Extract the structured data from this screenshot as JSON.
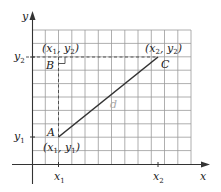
{
  "diagram": {
    "type": "coordinate-distance",
    "axes": {
      "x_label": "x",
      "y_label": "y"
    },
    "grid": {
      "columns": 12,
      "rows": 10,
      "color": "#9a9a9a"
    },
    "ticks": {
      "x": [
        {
          "label": "x",
          "sub": "1"
        },
        {
          "label": "x",
          "sub": "2"
        }
      ],
      "y": [
        {
          "label": "y",
          "sub": "1"
        },
        {
          "label": "y",
          "sub": "2"
        }
      ]
    },
    "points": {
      "A": {
        "name": "A",
        "coord": "(x1, y1)"
      },
      "B": {
        "name": "B",
        "coord": "(x1, y2)"
      },
      "C": {
        "name": "C",
        "coord": "(x2, y2)"
      }
    },
    "segment_label": "d",
    "colors": {
      "line": "#333333",
      "d_label": "#aaaaaa",
      "grid": "#9a9a9a"
    }
  }
}
